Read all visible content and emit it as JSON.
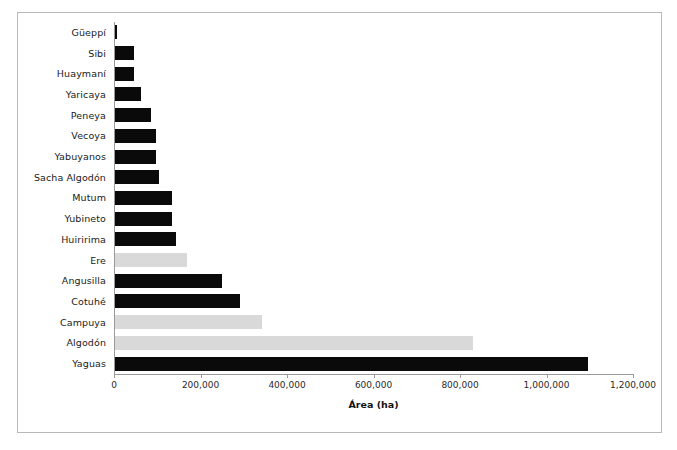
{
  "chart_data": {
    "type": "bar",
    "orientation": "horizontal",
    "title": "",
    "xlabel": "Área (ha)",
    "ylabel": "",
    "xlim": [
      0,
      1200000
    ],
    "xticks": [
      0,
      200000,
      400000,
      600000,
      800000,
      1000000,
      1200000
    ],
    "xtick_labels": [
      "0",
      "200,000",
      "400,000",
      "600,000",
      "800,000",
      "1,000,000",
      "1,200,000"
    ],
    "grid": false,
    "legend": "none",
    "colors": {
      "dark_bar": "#0a0a0a",
      "light_bar": "#d9d9d9",
      "axis": "#9a9a9a",
      "frame": "#b8b8b8",
      "text": "#1a1a1a"
    },
    "categories": [
      "Güeppí",
      "Sibi",
      "Huaymaní",
      "Yaricaya",
      "Peneya",
      "Vecoya",
      "Yabuyanos",
      "Sacha Algodón",
      "Mutum",
      "Yubineto",
      "Huiririma",
      "Ere",
      "Angusilla",
      "Cotuhé",
      "Campuya",
      "Algodón",
      "Yaguas"
    ],
    "values": [
      5000,
      44000,
      44000,
      61000,
      83000,
      94000,
      94000,
      101000,
      131000,
      131000,
      141000,
      166000,
      248000,
      290000,
      340000,
      828000,
      1093000
    ],
    "bar_styles": [
      "dark",
      "dark",
      "dark",
      "dark",
      "dark",
      "dark",
      "dark",
      "dark",
      "dark",
      "dark",
      "dark",
      "light",
      "dark",
      "dark",
      "light",
      "light",
      "dark"
    ]
  }
}
